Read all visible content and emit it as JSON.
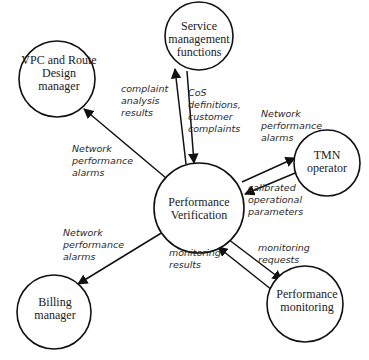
{
  "diagram": {
    "type": "data-flow",
    "nodes": [
      {
        "id": "smf",
        "lines": [
          "Service",
          "management",
          "functions"
        ]
      },
      {
        "id": "vpc",
        "lines": [
          "VPC and Route",
          "Design",
          "manager"
        ]
      },
      {
        "id": "tmn",
        "lines": [
          "TMN",
          "operator"
        ]
      },
      {
        "id": "pv",
        "lines": [
          "Performance",
          "Verification"
        ]
      },
      {
        "id": "billing",
        "lines": [
          "Billing",
          "manager"
        ]
      },
      {
        "id": "pm",
        "lines": [
          "Performance",
          "monitoring"
        ]
      }
    ],
    "edges": [
      {
        "from": "pv",
        "to": "smf",
        "lines": [
          "complaint",
          "analysis",
          "results"
        ]
      },
      {
        "from": "smf",
        "to": "pv",
        "lines": [
          "CoS",
          "definitions,",
          "customer",
          "complaints"
        ]
      },
      {
        "from": "pv",
        "to": "vpc",
        "lines": [
          "Network",
          "performance",
          "alarms"
        ]
      },
      {
        "from": "pv",
        "to": "tmn",
        "lines": [
          "Network",
          "performance",
          "alarms"
        ]
      },
      {
        "from": "tmn",
        "to": "pv",
        "lines": [
          "calibrated",
          "operational",
          "parameters"
        ]
      },
      {
        "from": "pv",
        "to": "billing",
        "lines": [
          "Network",
          "performance",
          "alarms"
        ]
      },
      {
        "from": "pv",
        "to": "pm",
        "lines": [
          "monitoring",
          "requests"
        ]
      },
      {
        "from": "pm",
        "to": "pv",
        "lines": [
          "monitoring",
          "results"
        ]
      }
    ]
  }
}
